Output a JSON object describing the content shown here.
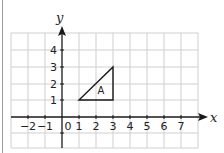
{
  "diagram": {
    "type": "coordinate-grid",
    "axes": {
      "x_label": "x",
      "y_label": "y",
      "x_ticks": [
        "−2",
        "−1",
        "1",
        "2",
        "3",
        "4",
        "5",
        "6",
        "7"
      ],
      "y_ticks": [
        "1",
        "2",
        "3",
        "4"
      ],
      "origin_label": "0",
      "x_range": [
        -3,
        8
      ],
      "y_range": [
        -2,
        5
      ]
    },
    "shape": {
      "label": "A",
      "vertices": [
        [
          1,
          1
        ],
        [
          3,
          1
        ],
        [
          3,
          3
        ]
      ]
    },
    "colors": {
      "grid": "#cfcfcf",
      "axis": "#1a1a1a",
      "shape": "#1a1a1a",
      "border": "#9a9a9a"
    }
  }
}
